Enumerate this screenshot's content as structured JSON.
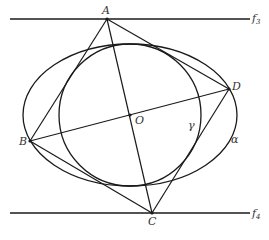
{
  "diagram": {
    "title": "",
    "stroke_color": "#1a1a1a",
    "label_color": "#333333",
    "lines": [
      {
        "name": "f3",
        "label": "f",
        "subscript": "3",
        "x1": 10,
        "y1": 19,
        "x2": 250,
        "y2": 19,
        "label_x": 252,
        "label_y": 22
      },
      {
        "name": "f4",
        "label": "f",
        "subscript": "4",
        "x1": 10,
        "y1": 213,
        "x2": 250,
        "y2": 213,
        "label_x": 252,
        "label_y": 217
      }
    ],
    "points": [
      {
        "name": "A",
        "x": 107,
        "y": 19,
        "label_x": 102,
        "label_y": 14
      },
      {
        "name": "B",
        "x": 30,
        "y": 141,
        "label_x": 19,
        "label_y": 145
      },
      {
        "name": "C",
        "x": 152,
        "y": 213,
        "label_x": 148,
        "label_y": 225
      },
      {
        "name": "D",
        "x": 229,
        "y": 89,
        "label_x": 232,
        "label_y": 90
      },
      {
        "name": "O",
        "x": 130,
        "y": 115,
        "label_x": 135,
        "label_y": 124
      }
    ],
    "curves": [
      {
        "name": "gamma-circle",
        "label": "γ",
        "cx": 130,
        "cy": 115,
        "r": 71,
        "label_x": 188,
        "label_y": 129
      },
      {
        "name": "alpha-ellipse",
        "label": "α",
        "cx": 130,
        "cy": 115,
        "rx": 107,
        "ry": 71,
        "label_x": 231,
        "label_y": 143
      }
    ],
    "segments": [
      {
        "name": "segment-AB",
        "from": "A",
        "to": "B"
      },
      {
        "name": "segment-AD",
        "from": "A",
        "to": "D"
      },
      {
        "name": "segment-BC",
        "from": "B",
        "to": "C"
      },
      {
        "name": "segment-CD",
        "from": "C",
        "to": "D"
      },
      {
        "name": "segment-AC",
        "from": "A",
        "to": "C"
      },
      {
        "name": "segment-BD",
        "from": "B",
        "to": "D"
      }
    ]
  }
}
